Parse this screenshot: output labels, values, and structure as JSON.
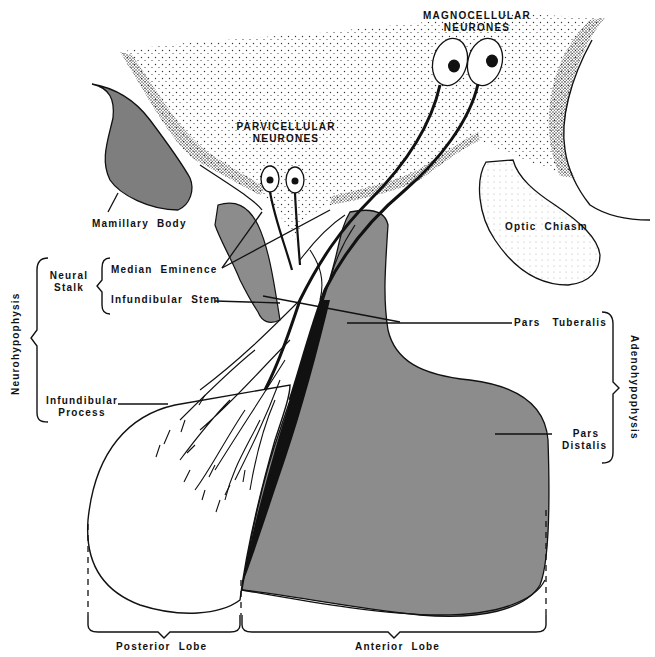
{
  "diagram": {
    "colors": {
      "ink": "#111111",
      "stipple": "#3a3a3a",
      "gland_gray": "#8c8c8c",
      "mamillary_gray": "#7a7a7a",
      "background": "#ffffff"
    },
    "labels": {
      "magnocellular_line1": "MAGNOCELLULAR",
      "magnocellular_line2": "NEURONES",
      "parvicellular_line1": "PARVICELLULAR",
      "parvicellular_line2": "NEURONES",
      "mamillary_body": "Mamillary  Body",
      "optic_chiasm": "Optic  Chiasm",
      "neural_stalk_line1": "Neural",
      "neural_stalk_line2": "Stalk",
      "median_eminence": "Median  Eminence",
      "infundibular_stem": "Infundibular  Stem",
      "neurohypophysis": "Neurohypophysis",
      "infundibular_process_line1": "Infundibular",
      "infundibular_process_line2": "Process",
      "pars_tuberalis": "Pars   Tuberalis",
      "pars_distalis_line1": "Pars",
      "pars_distalis_line2": "Distalis",
      "adenohypophysis": "Adenohypophysis",
      "posterior_lobe": "Posterior  Lobe",
      "anterior_lobe": "Anterior  Lobe"
    },
    "groupings": [
      {
        "bracket": "Neurohypophysis",
        "contains": [
          "Neural Stalk",
          "Infundibular Process"
        ]
      },
      {
        "bracket": "Neural Stalk",
        "contains": [
          "Median Eminence",
          "Infundibular Stem"
        ]
      },
      {
        "bracket": "Adenohypophysis",
        "contains": [
          "Pars Tuberalis",
          "Pars Distalis"
        ]
      },
      {
        "bracket": "Posterior Lobe",
        "contains": [
          "Infundibular Process"
        ]
      },
      {
        "bracket": "Anterior Lobe",
        "contains": [
          "Pars Distalis"
        ]
      }
    ]
  }
}
